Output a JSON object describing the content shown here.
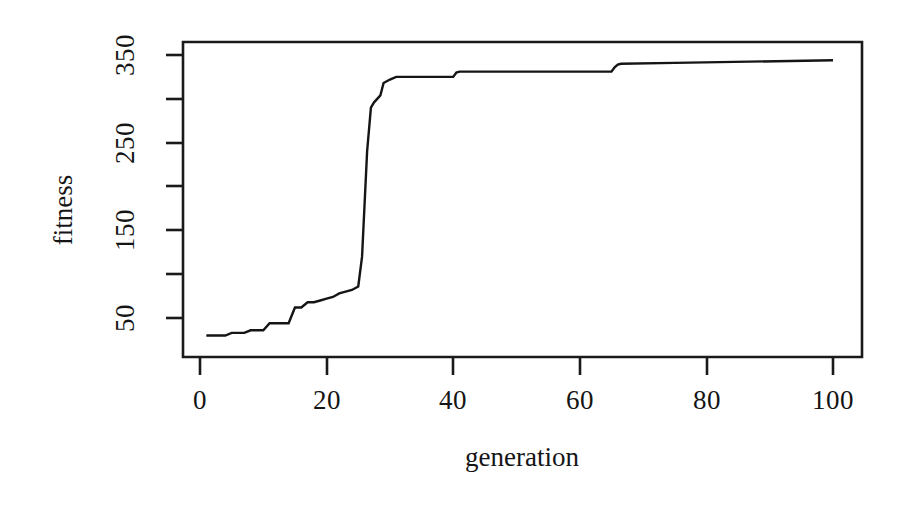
{
  "chart_data": {
    "type": "line",
    "title": "",
    "subtitle": "",
    "xlabel": "generation",
    "ylabel": "fitness",
    "xlim": [
      0,
      103
    ],
    "ylim": [
      0,
      360
    ],
    "xticks": [
      0,
      20,
      40,
      60,
      80,
      100
    ],
    "xtick_labels": [
      "0",
      "20",
      "40",
      "60",
      "80",
      "100"
    ],
    "yticks": [
      50,
      100,
      150,
      200,
      250,
      300,
      350
    ],
    "ytick_labels": [
      "50",
      "",
      "150",
      "",
      "250",
      "",
      "350"
    ],
    "ytick_labels_shown": [
      "50",
      "150",
      "250",
      "350"
    ],
    "grid": false,
    "legend": false,
    "legend_position": "none",
    "line_color": "#151515",
    "series": [
      {
        "name": "best fitness",
        "x": [
          1,
          4,
          5,
          7,
          8,
          10,
          11,
          12,
          13,
          14,
          15,
          16,
          17,
          18,
          19,
          20,
          21,
          22,
          23,
          24,
          25,
          25.6,
          26,
          26.4,
          27,
          27.5,
          28,
          28.5,
          29,
          30,
          31,
          36,
          40,
          40.5,
          41,
          65,
          65.5,
          66,
          66.5,
          75,
          100
        ],
        "y": [
          30,
          30,
          33,
          33,
          36,
          36,
          44,
          44,
          44,
          44,
          62,
          62,
          68,
          68,
          70,
          72,
          74,
          78,
          80,
          82,
          86,
          120,
          180,
          240,
          290,
          296,
          300,
          304,
          318,
          322,
          325,
          325,
          325,
          330,
          331,
          331,
          336,
          339,
          340,
          341,
          344
        ]
      }
    ]
  },
  "axis": {
    "y_title": "fitness",
    "x_title": "generation"
  }
}
